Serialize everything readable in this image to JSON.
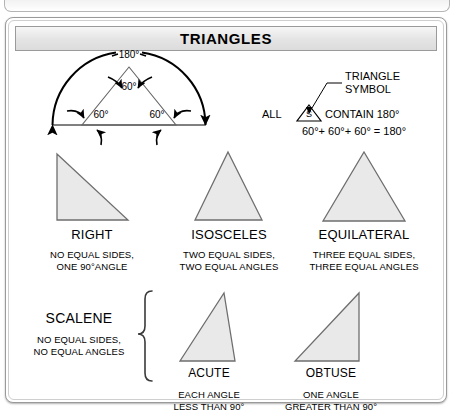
{
  "header": {
    "title": "TRIANGLES"
  },
  "angle_sum_diagram": {
    "arc_label": "180°",
    "apex_angle": "60°",
    "left_base_angle": "60°",
    "right_base_angle": "60°"
  },
  "symbol_note": {
    "callout_line1": "TRIANGLE",
    "callout_line2": "SYMBOL",
    "symbol_letter": "S",
    "sentence_prefix": "ALL",
    "sentence_suffix": "CONTAIN 180°",
    "equation": "60°+ 60°+ 60° = 180°"
  },
  "types": [
    {
      "name": "RIGHT",
      "desc_line1": "NO EQUAL SIDES,",
      "desc_line2": "ONE 90°ANGLE"
    },
    {
      "name": "ISOSCELES",
      "desc_line1": "TWO EQUAL SIDES,",
      "desc_line2": "TWO EQUAL ANGLES"
    },
    {
      "name": "EQUILATERAL",
      "desc_line1": "THREE EQUAL SIDES,",
      "desc_line2": "THREE EQUAL ANGLES"
    }
  ],
  "scalene": {
    "name": "SCALENE",
    "desc_line1": "NO EQUAL SIDES,",
    "desc_line2": "NO EQUAL ANGLES",
    "variants": [
      {
        "name": "ACUTE",
        "desc_line1": "EACH ANGLE",
        "desc_line2": "LESS THAN 90°"
      },
      {
        "name": "OBTUSE",
        "desc_line1": "ONE ANGLE",
        "desc_line2": "GREATER THAN 90°"
      }
    ]
  },
  "colors": {
    "triangle_fill": "#e9e9e9",
    "triangle_stroke": "#6e6e6e",
    "ink": "#000000",
    "frame": "#9a9a9a",
    "title_bg": "#e4e4e4"
  }
}
